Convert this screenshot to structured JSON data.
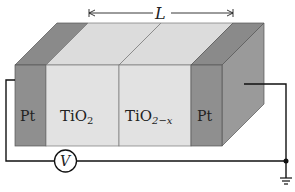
{
  "diagram": {
    "dimension_label": "L",
    "layers": [
      {
        "label": "Pt",
        "sub": "",
        "color": "#8f8f8f"
      },
      {
        "label": "TiO",
        "sub": "2",
        "color": "#e0e0e0"
      },
      {
        "label": "TiO",
        "sub": "2−x",
        "color": "#e0e0e0"
      },
      {
        "label": "Pt",
        "sub": "",
        "color": "#8f8f8f"
      }
    ],
    "voltmeter_label": "V",
    "ground": "ground-symbol"
  }
}
